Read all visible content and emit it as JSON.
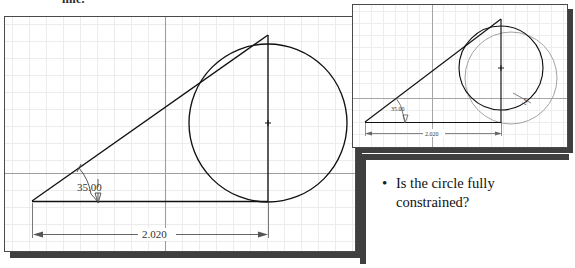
{
  "slide": {
    "top_caption": "line."
  },
  "main_drawing": {
    "name": "main-sketch",
    "angle_dimension": "35.00",
    "length_dimension": "2.020",
    "grid": {
      "minor_spacing_px": 17,
      "minor_color": "#e9e9e9",
      "major_color": "#b9b9b9"
    },
    "geometry": {
      "circle": {
        "cx": 263,
        "cy": 106,
        "r": 79,
        "color": "#111111"
      },
      "apex": {
        "x": 27,
        "y": 184
      },
      "tangent_top": {
        "x": 263,
        "y": 18
      },
      "baseline_y": 184,
      "axis_h_y": 156,
      "axis_v_x": 160
    }
  },
  "inset_drawing": {
    "name": "inset-sketch",
    "angle_dimension": "35.00",
    "length_dimension": "2.020",
    "diameter_dimension": "1.0",
    "geometry": {
      "circle_solid": {
        "cx": 148,
        "cy": 63,
        "r": 42,
        "color": "#111111"
      },
      "circle_phantom": {
        "cx": 158,
        "cy": 73,
        "r": 46,
        "color": "#9a9a9a"
      },
      "apex": {
        "x": 12,
        "y": 117
      },
      "tangent_top": {
        "x": 148,
        "y": 14
      },
      "baseline_y": 117,
      "axis_h_y": 93,
      "axis_v_x": 79
    }
  },
  "question_panel": {
    "bullet_glyph": "•",
    "text": "Is the circle fully constrained?"
  },
  "colors": {
    "line": "#111111",
    "phantom": "#9a9a9a",
    "dimension": "#333333",
    "shadow": "#3f3f3f",
    "sheet_border": "#4a4a4a",
    "background": "#ffffff"
  }
}
